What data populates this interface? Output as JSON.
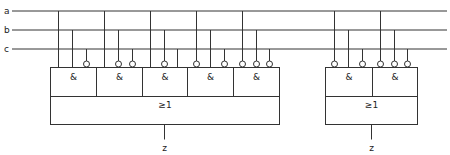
{
  "diagram": {
    "type": "logic-circuit",
    "inputs": [
      {
        "name": "a",
        "y": 11
      },
      {
        "name": "b",
        "y": 30
      },
      {
        "name": "c",
        "y": 49
      }
    ],
    "bus": {
      "x_start": 12,
      "x_end": 447
    },
    "blocks": [
      {
        "id": "left",
        "x": 50,
        "width": 229,
        "and_top": 67,
        "and_height": 29,
        "or_height": 28,
        "or_label": "≥1",
        "output_label": "z",
        "output_x": 164,
        "gates": [
          {
            "label": "&",
            "x": 50,
            "w": 46,
            "inputs": [
              {
                "signal": "a",
                "x": 58,
                "inverted": false
              },
              {
                "signal": "b",
                "x": 72,
                "inverted": false
              },
              {
                "signal": "c",
                "x": 86,
                "inverted": true
              }
            ]
          },
          {
            "label": "&",
            "x": 96,
            "w": 46,
            "inputs": [
              {
                "signal": "a",
                "x": 104,
                "inverted": false
              },
              {
                "signal": "b",
                "x": 118,
                "inverted": true
              },
              {
                "signal": "c",
                "x": 132,
                "inverted": true
              }
            ]
          },
          {
            "label": "&",
            "x": 142,
            "w": 45,
            "inputs": [
              {
                "signal": "a",
                "x": 150,
                "inverted": false
              },
              {
                "signal": "b",
                "x": 164,
                "inverted": true
              },
              {
                "signal": "c",
                "x": 177,
                "inverted": false
              }
            ]
          },
          {
            "label": "&",
            "x": 187,
            "w": 46,
            "inputs": [
              {
                "signal": "a",
                "x": 196,
                "inverted": true
              },
              {
                "signal": "b",
                "x": 210,
                "inverted": false
              },
              {
                "signal": "c",
                "x": 224,
                "inverted": true
              }
            ]
          },
          {
            "label": "&",
            "x": 233,
            "w": 46,
            "inputs": [
              {
                "signal": "a",
                "x": 242,
                "inverted": true
              },
              {
                "signal": "b",
                "x": 256,
                "inverted": true
              },
              {
                "signal": "c",
                "x": 269,
                "inverted": true
              }
            ]
          }
        ]
      },
      {
        "id": "right",
        "x": 325,
        "width": 92,
        "and_top": 67,
        "and_height": 29,
        "or_height": 28,
        "or_label": "≥1",
        "output_label": "z",
        "output_x": 371,
        "gates": [
          {
            "label": "&",
            "x": 325,
            "w": 47,
            "inputs": [
              {
                "signal": "a",
                "x": 334,
                "inverted": true
              },
              {
                "signal": "b",
                "x": 348,
                "inverted": false
              },
              {
                "signal": "c",
                "x": 362,
                "inverted": true
              }
            ]
          },
          {
            "label": "&",
            "x": 372,
            "w": 45,
            "inputs": [
              {
                "signal": "a",
                "x": 380,
                "inverted": true
              },
              {
                "signal": "b",
                "x": 394,
                "inverted": true
              },
              {
                "signal": "c",
                "x": 407,
                "inverted": true
              }
            ]
          }
        ]
      }
    ]
  }
}
